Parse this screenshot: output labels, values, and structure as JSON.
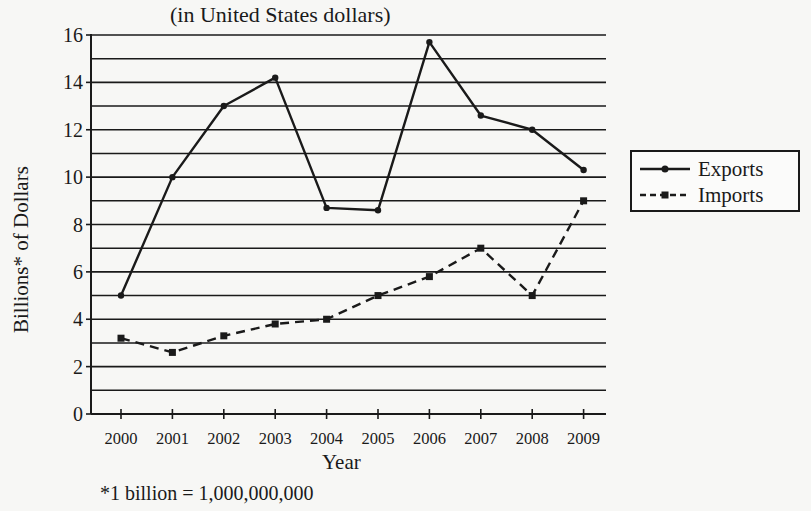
{
  "chart_data": {
    "type": "line",
    "title": "",
    "subtitle": "(in United States dollars)",
    "xlabel": "Year",
    "ylabel": "Billions* of Dollars",
    "footnote": "*1 billion = 1,000,000,000",
    "categories": [
      "2000",
      "2001",
      "2002",
      "2003",
      "2004",
      "2005",
      "2006",
      "2007",
      "2008",
      "2009"
    ],
    "series": [
      {
        "name": "Exports",
        "style": "solid",
        "marker": "circle",
        "values": [
          5.0,
          10.0,
          13.0,
          14.2,
          8.7,
          8.6,
          15.7,
          12.6,
          12.0,
          10.3
        ]
      },
      {
        "name": "Imports",
        "style": "dashed",
        "marker": "square",
        "values": [
          3.2,
          2.6,
          3.3,
          3.8,
          4.0,
          5.0,
          5.8,
          7.0,
          5.0,
          9.0
        ]
      }
    ],
    "ylim": [
      0,
      16
    ],
    "yticks": [
      0,
      2,
      4,
      6,
      8,
      10,
      12,
      14,
      16
    ],
    "grid": {
      "horizontal": true,
      "step": 1
    },
    "legend": {
      "position": "right",
      "entries": [
        "Exports",
        "Imports"
      ]
    },
    "colors": {
      "line": "#1a1a1a",
      "grid": "#1a1a1a",
      "background": "#f7f7f5"
    }
  },
  "labels": {
    "subtitle": "(in United States dollars)",
    "xlabel": "Year",
    "ylabel": "Billions* of Dollars",
    "footnote": "*1 billion = 1,000,000,000",
    "legend_exports": "Exports",
    "legend_imports": "Imports"
  }
}
